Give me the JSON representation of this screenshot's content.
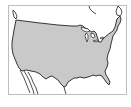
{
  "map": {
    "subject": "contiguous-united-states",
    "fill_color": "#c9c9c9",
    "outline_color": "#222222",
    "frame_color": "#bdbdbd",
    "background": "#ffffff"
  }
}
